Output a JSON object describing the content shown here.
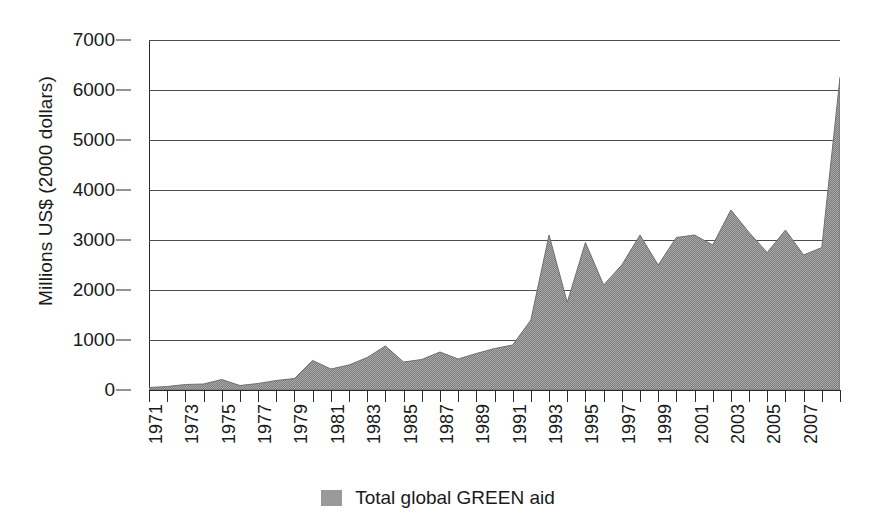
{
  "chart_data": {
    "type": "area",
    "title": "",
    "xlabel": "",
    "ylabel": "Millions US$ (2000 dollars)",
    "ylim": [
      0,
      7000
    ],
    "xlim": [
      1971,
      2009
    ],
    "ytick_values": [
      7000,
      6000,
      5000,
      4000,
      3000,
      2000,
      1000,
      0
    ],
    "ytick_labels": [
      "7000",
      "6000",
      "5000",
      "4000",
      "3000",
      "2000",
      "1000",
      "0"
    ],
    "xtick_labels": [
      "1971",
      "1973",
      "1975",
      "1977",
      "1979",
      "1981",
      "1983",
      "1985",
      "1987",
      "1989",
      "1991",
      "1993",
      "1995",
      "1997",
      "1999",
      "2001",
      "2003",
      "2005",
      "2007"
    ],
    "xtick_label_years": [
      1971,
      1973,
      1975,
      1977,
      1979,
      1981,
      1983,
      1985,
      1987,
      1989,
      1991,
      1993,
      1995,
      1997,
      1999,
      2001,
      2003,
      2005,
      2007
    ],
    "grid": true,
    "legend_position": "bottom-center",
    "legend": [
      {
        "name": "Total global GREEN aid",
        "color": "#9a9a9a"
      }
    ],
    "series": [
      {
        "name": "Total global GREEN aid",
        "color": "#9a9a9a",
        "x": [
          1971,
          1972,
          1973,
          1974,
          1975,
          1976,
          1977,
          1978,
          1979,
          1980,
          1981,
          1982,
          1983,
          1984,
          1985,
          1986,
          1987,
          1988,
          1989,
          1990,
          1991,
          1992,
          1993,
          1994,
          1995,
          1996,
          1997,
          1998,
          1999,
          2000,
          2001,
          2002,
          2003,
          2004,
          2005,
          2006,
          2007,
          2008,
          2009
        ],
        "values": [
          50,
          70,
          110,
          120,
          210,
          90,
          130,
          190,
          230,
          590,
          420,
          500,
          650,
          880,
          560,
          610,
          760,
          620,
          730,
          830,
          900,
          1400,
          3100,
          1750,
          2950,
          2100,
          2500,
          3100,
          2500,
          3050,
          3100,
          2900,
          3600,
          3150,
          2750,
          3200,
          2700,
          2850,
          6250
        ]
      }
    ],
    "annotations": []
  },
  "legend": {
    "label": "Total global GREEN aid"
  },
  "axis": {
    "y_title": "Millions US$ (2000 dollars)"
  }
}
